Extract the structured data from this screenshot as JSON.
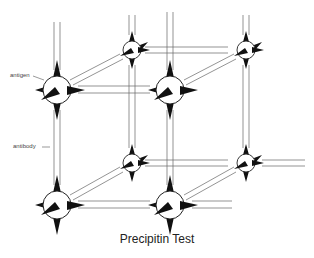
{
  "figure": {
    "title": "Precipitin Test",
    "labels": {
      "antigen": "antigen",
      "antibody": "antibody"
    },
    "colors": {
      "line": "#555555",
      "spike": "#111111",
      "node_fill": "#ffffff",
      "background": "#ffffff"
    },
    "nodes": [
      {
        "id": "front-top-left",
        "x": 57,
        "y": 90,
        "r": 14,
        "layer": "front"
      },
      {
        "id": "front-top-right",
        "x": 170,
        "y": 90,
        "r": 14,
        "layer": "front"
      },
      {
        "id": "front-bottom-left",
        "x": 57,
        "y": 205,
        "r": 14,
        "layer": "front"
      },
      {
        "id": "front-bottom-right",
        "x": 170,
        "y": 205,
        "r": 14,
        "layer": "front"
      },
      {
        "id": "back-top-left",
        "x": 132,
        "y": 50,
        "r": 9,
        "layer": "back"
      },
      {
        "id": "back-top-right",
        "x": 246,
        "y": 50,
        "r": 9,
        "layer": "back"
      },
      {
        "id": "back-bottom-left",
        "x": 132,
        "y": 163,
        "r": 9,
        "layer": "back"
      },
      {
        "id": "back-bottom-right",
        "x": 246,
        "y": 163,
        "r": 9,
        "layer": "back"
      }
    ]
  }
}
